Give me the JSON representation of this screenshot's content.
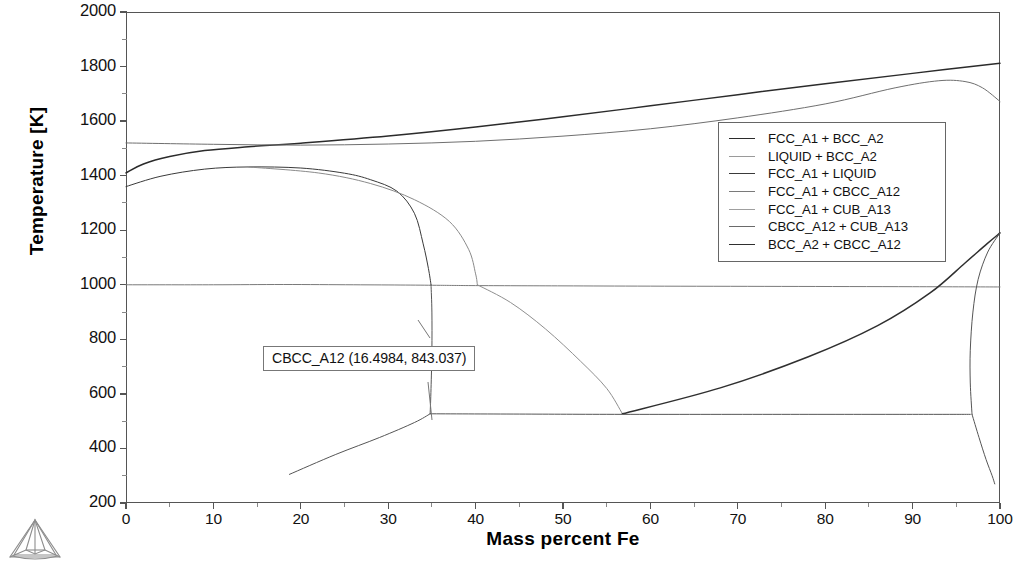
{
  "chart_data": {
    "type": "line",
    "title": "",
    "xlabel": "Mass percent Fe",
    "ylabel": "Temperature [K]",
    "xlim": [
      0,
      100
    ],
    "ylim": [
      200,
      2000
    ],
    "xticks": [
      0,
      10,
      20,
      30,
      40,
      50,
      60,
      70,
      80,
      90,
      100
    ],
    "yticks": [
      200,
      400,
      600,
      800,
      1000,
      1200,
      1400,
      1600,
      1800,
      2000
    ],
    "grid": false,
    "legend_position": "upper-right",
    "series": [
      {
        "name": "FCC_A1 + BCC_A2",
        "color": "#2b2b2b",
        "points": [
          [
            0,
            1410
          ],
          [
            2,
            1443
          ],
          [
            5,
            1470
          ],
          [
            9,
            1492
          ],
          [
            14,
            1506
          ],
          [
            20,
            1519
          ],
          [
            30,
            1545
          ],
          [
            40,
            1578
          ],
          [
            50,
            1616
          ],
          [
            60,
            1656
          ],
          [
            70,
            1697
          ],
          [
            80,
            1737
          ],
          [
            90,
            1775
          ],
          [
            100,
            1812
          ]
        ]
      },
      {
        "name": "LIQUID + BCC_A2",
        "color": "#6f6f6f",
        "points": [
          [
            0,
            1520
          ],
          [
            10,
            1515
          ],
          [
            20,
            1512
          ],
          [
            30,
            1516
          ],
          [
            40,
            1526
          ],
          [
            50,
            1545
          ],
          [
            60,
            1572
          ],
          [
            70,
            1612
          ],
          [
            80,
            1663
          ],
          [
            88,
            1722
          ],
          [
            93,
            1748
          ],
          [
            96,
            1745
          ],
          [
            98,
            1722
          ],
          [
            100,
            1672
          ]
        ]
      },
      {
        "name": "FCC_A1 + LIQUID",
        "color": "#3a3a3a",
        "points": [
          [
            0,
            1360
          ],
          [
            4,
            1398
          ],
          [
            9,
            1424
          ],
          [
            14,
            1432
          ],
          [
            20,
            1428
          ],
          [
            25,
            1409
          ],
          [
            28,
            1385
          ],
          [
            31,
            1343
          ],
          [
            33,
            1262
          ],
          [
            34,
            1150
          ],
          [
            34.6,
            1060
          ],
          [
            34.9,
            1000
          ]
        ]
      },
      {
        "name": "FCC_A1 + CBCC_A12",
        "color": "#7a7a7a",
        "points": [
          [
            0,
            1000
          ],
          [
            10,
            1000
          ],
          [
            18,
            1001
          ],
          [
            26,
            1000
          ],
          [
            32,
            999
          ],
          [
            36,
            998
          ],
          [
            40,
            997
          ],
          [
            50,
            996
          ],
          [
            60,
            995
          ],
          [
            75,
            994
          ],
          [
            90,
            993
          ],
          [
            100,
            992
          ]
        ]
      },
      {
        "name": "FCC_A1 + CUB_A13",
        "color": "#8a8a8a",
        "points": [
          [
            14,
            1432
          ],
          [
            22,
            1410
          ],
          [
            28,
            1371
          ],
          [
            33,
            1312
          ],
          [
            37,
            1232
          ],
          [
            39.2,
            1130
          ],
          [
            40,
            1040
          ],
          [
            40.2,
            1000
          ]
        ]
      },
      {
        "name": "CBCC_A12 + CUB_A13",
        "color": "#8f8f8f",
        "points": [
          [
            40.2,
            1000
          ],
          [
            44,
            935
          ],
          [
            48,
            838
          ],
          [
            52,
            720
          ],
          [
            55,
            620
          ],
          [
            56.8,
            527
          ]
        ]
      },
      {
        "name": "BCC_A2 + CBCC_A12",
        "color": "#2f2f2f",
        "points": [
          [
            56.8,
            527
          ],
          [
            68,
            622
          ],
          [
            78,
            735
          ],
          [
            86,
            850
          ],
          [
            92,
            970
          ],
          [
            96,
            1080
          ],
          [
            98.5,
            1150
          ],
          [
            100,
            1190
          ]
        ]
      }
    ],
    "extra_boundaries": [
      {
        "name": "solvus-left-descent",
        "points": [
          [
            34.9,
            1000
          ],
          [
            35,
            900
          ],
          [
            35,
            760
          ],
          [
            34.9,
            620
          ],
          [
            34.8,
            527
          ]
        ]
      },
      {
        "name": "eutectic-isotherm-525K",
        "points": [
          [
            34.8,
            527
          ],
          [
            45,
            526
          ],
          [
            56.8,
            525
          ],
          [
            75,
            525
          ],
          [
            90,
            525
          ],
          [
            96.6,
            525
          ]
        ]
      },
      {
        "name": "low-left-diagonal",
        "points": [
          [
            18.7,
            305
          ],
          [
            24,
            378
          ],
          [
            29,
            440
          ],
          [
            33,
            495
          ],
          [
            34.8,
            527
          ]
        ]
      },
      {
        "name": "right-edge-upper-arc",
        "points": [
          [
            100,
            1190
          ],
          [
            98.6,
            1120
          ],
          [
            97.5,
            1020
          ],
          [
            96.9,
            900
          ],
          [
            96.6,
            760
          ],
          [
            96.6,
            640
          ],
          [
            96.8,
            525
          ]
        ]
      },
      {
        "name": "right-edge-lower-arc",
        "points": [
          [
            96.8,
            525
          ],
          [
            97.6,
            440
          ],
          [
            98.4,
            360
          ],
          [
            99.1,
            300
          ],
          [
            99.4,
            270
          ]
        ]
      }
    ],
    "annotation": {
      "label": "CBCC_A12 (16.4984, 843.037)",
      "x": 16.4984,
      "y": 843.037
    }
  },
  "axes": {
    "ylabel": "Temperature [K]",
    "xlabel": "Mass percent Fe",
    "yticks": [
      "2000",
      "1800",
      "1600",
      "1400",
      "1200",
      "1000",
      "800",
      "600",
      "400",
      "200"
    ],
    "xticks": [
      "0",
      "10",
      "20",
      "30",
      "40",
      "50",
      "60",
      "70",
      "80",
      "90",
      "100"
    ]
  },
  "legend": {
    "items": [
      {
        "label": "FCC_A1 + BCC_A2",
        "color": "#2b2b2b"
      },
      {
        "label": "LIQUID + BCC_A2",
        "color": "#9a9a9a"
      },
      {
        "label": "FCC_A1 + LIQUID",
        "color": "#3a3a3a"
      },
      {
        "label": "FCC_A1 + CBCC_A12",
        "color": "#7a7a7a"
      },
      {
        "label": "FCC_A1 + CUB_A13",
        "color": "#9f9f9f"
      },
      {
        "label": "CBCC_A12 + CUB_A13",
        "color": "#6a6a6a"
      },
      {
        "label": "BCC_A2 + CBCC_A12",
        "color": "#2f2f2f"
      }
    ]
  },
  "annotation": {
    "text": "CBCC_A12 (16.4984, 843.037)"
  },
  "logo": {
    "name": "tetrahedron-wireframe-logo"
  }
}
